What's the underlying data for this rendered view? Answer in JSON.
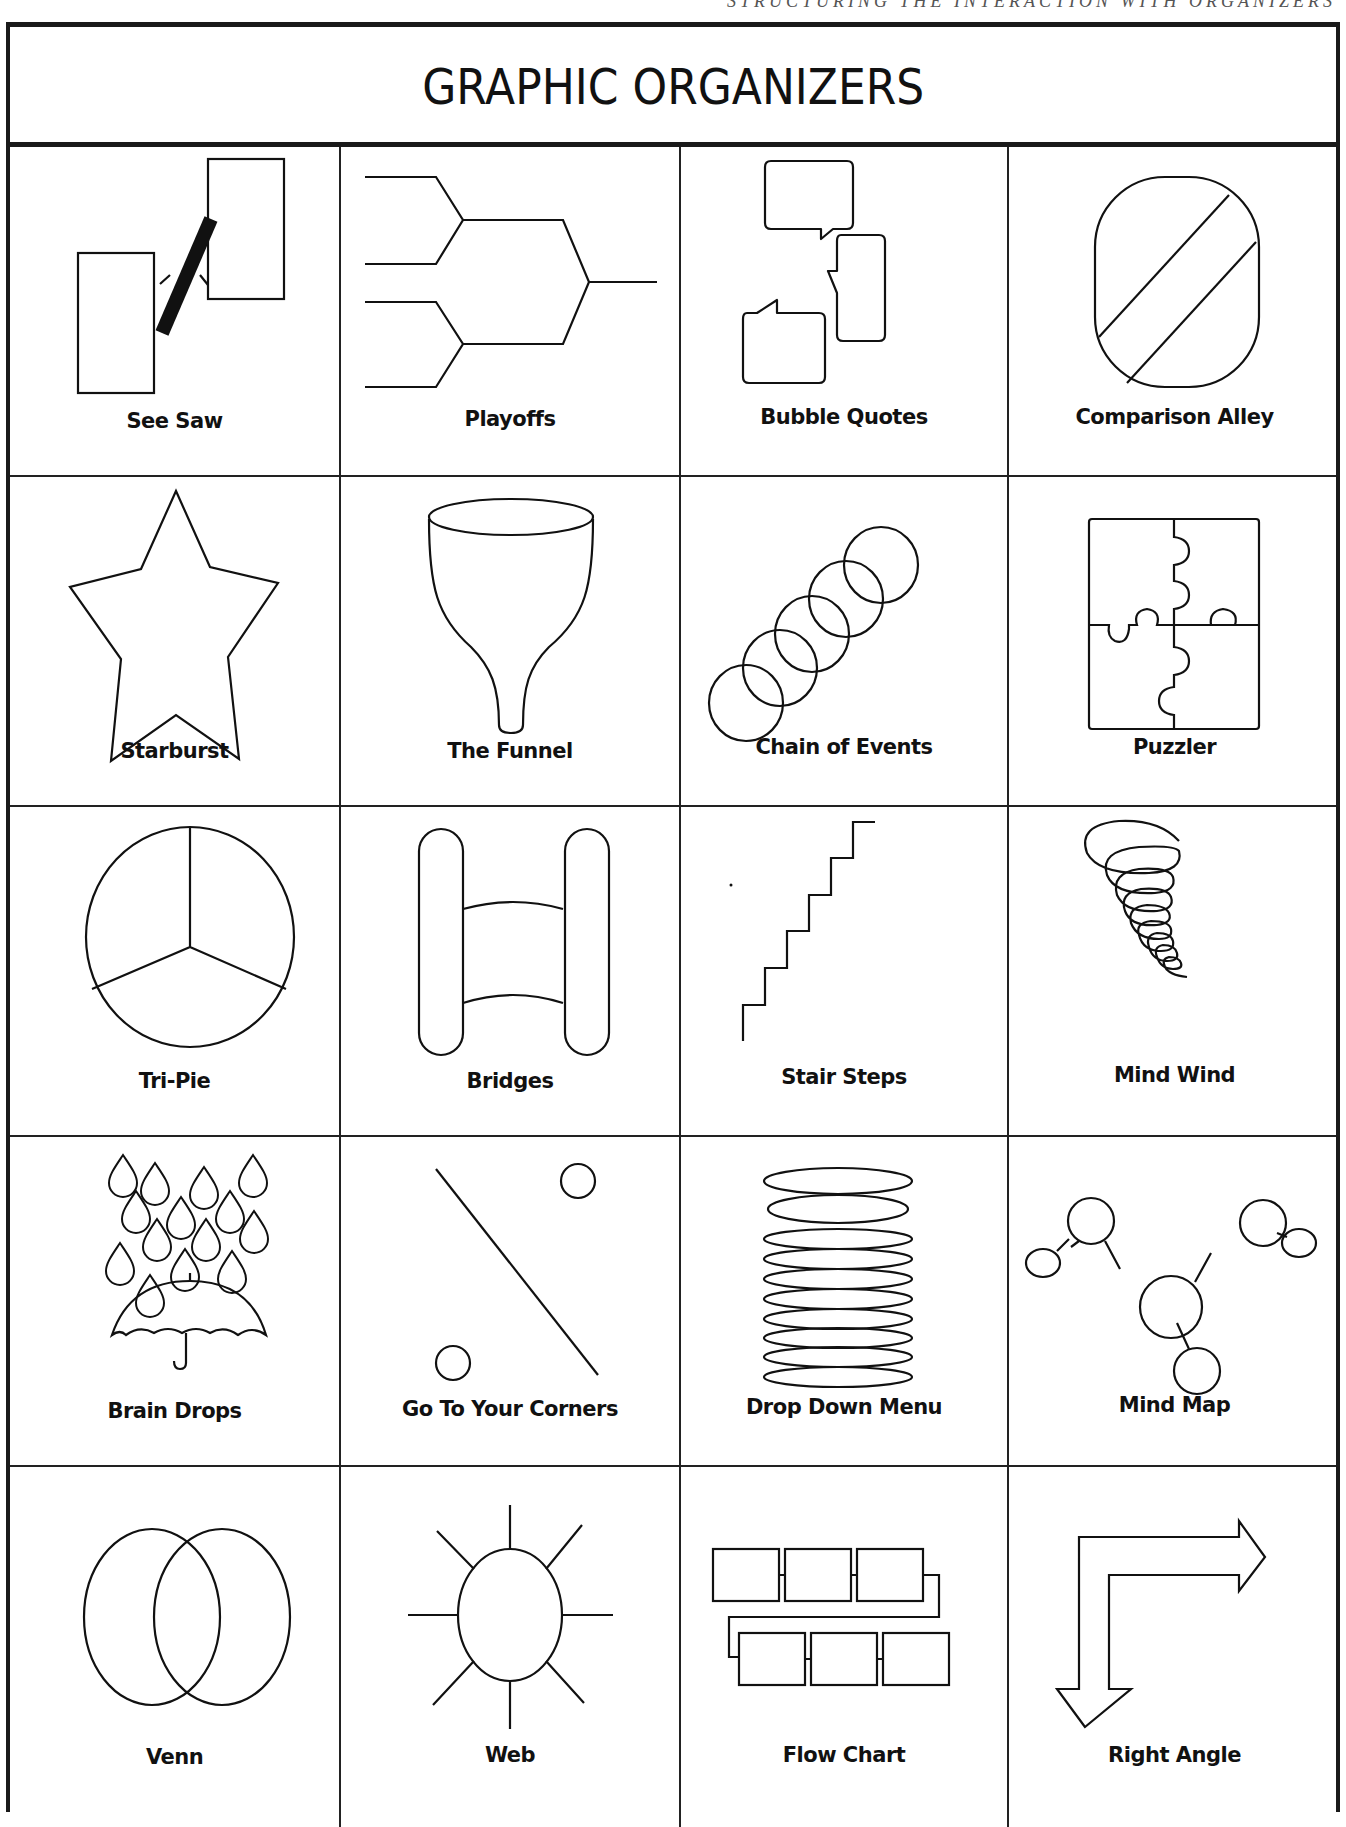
{
  "page": {
    "running_header": "STRUCTURING THE INTERACTION WITH ORGANIZERS",
    "title": "GRAPHIC ORGANIZERS"
  },
  "organizers": [
    {
      "label": "See Saw",
      "icon": "see-saw-icon"
    },
    {
      "label": "Playoffs",
      "icon": "bracket-icon"
    },
    {
      "label": "Bubble Quotes",
      "icon": "speech-bubbles-icon"
    },
    {
      "label": "Comparison Alley",
      "icon": "comparison-alley-icon"
    },
    {
      "label": "Starburst",
      "icon": "star-icon"
    },
    {
      "label": "The Funnel",
      "icon": "funnel-icon"
    },
    {
      "label": "Chain of Events",
      "icon": "chain-rings-icon"
    },
    {
      "label": "Puzzler",
      "icon": "puzzle-icon"
    },
    {
      "label": "Tri-Pie",
      "icon": "tri-pie-icon"
    },
    {
      "label": "Bridges",
      "icon": "bridges-icon"
    },
    {
      "label": "Stair Steps",
      "icon": "stairs-icon"
    },
    {
      "label": "Mind Wind",
      "icon": "spiral-tornado-icon"
    },
    {
      "label": "Brain Drops",
      "icon": "raindrops-umbrella-icon"
    },
    {
      "label": "Go To Your Corners",
      "icon": "corners-icon"
    },
    {
      "label": "Drop Down Menu",
      "icon": "stacked-ovals-icon"
    },
    {
      "label": "Mind Map",
      "icon": "mind-map-icon"
    },
    {
      "label": "Venn",
      "icon": "venn-icon"
    },
    {
      "label": "Web",
      "icon": "web-sun-icon"
    },
    {
      "label": "Flow Chart",
      "icon": "flow-chart-icon"
    },
    {
      "label": "Right Angle",
      "icon": "right-angle-arrow-icon"
    }
  ],
  "layout": {
    "columns": 4,
    "rows": 5
  }
}
